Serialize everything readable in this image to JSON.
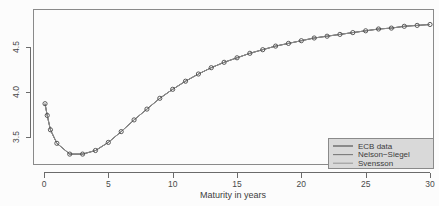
{
  "chart_data": {
    "type": "line",
    "title": "",
    "xlabel": "Maturity in years",
    "ylabel": "",
    "xlim": [
      -1.2,
      31.5
    ],
    "ylim": [
      3.2,
      4.85
    ],
    "xticks": [
      0,
      5,
      10,
      15,
      20,
      25,
      30
    ],
    "xtick_labels": [
      "0",
      "5",
      "10",
      "15",
      "20",
      "25",
      "30"
    ],
    "yticks": [
      3.5,
      4.0,
      4.5
    ],
    "ytick_labels": [
      "3.5",
      "4.0",
      "4.5"
    ],
    "grid": false,
    "legend_position": "bottom-right",
    "x": [
      0.08,
      0.25,
      0.5,
      1,
      2,
      3,
      4,
      5,
      6,
      7,
      8,
      9,
      10,
      11,
      12,
      13,
      14,
      15,
      16,
      17,
      18,
      19,
      20,
      21,
      22,
      23,
      24,
      25,
      26,
      27,
      28,
      29,
      30
    ],
    "series": [
      {
        "name": "ECB data",
        "color": "#4a4a4a",
        "marker": "circle",
        "values": [
          3.87,
          3.74,
          3.58,
          3.43,
          3.31,
          3.31,
          3.35,
          3.44,
          3.56,
          3.69,
          3.81,
          3.93,
          4.03,
          4.12,
          4.2,
          4.27,
          4.33,
          4.38,
          4.43,
          4.47,
          4.51,
          4.54,
          4.57,
          4.6,
          4.62,
          4.64,
          4.66,
          4.68,
          4.7,
          4.71,
          4.73,
          4.74,
          4.75
        ]
      },
      {
        "name": "Nelson−Siegel",
        "color": "#6e6e6e",
        "marker": "none",
        "values": [
          3.87,
          3.74,
          3.58,
          3.43,
          3.31,
          3.31,
          3.35,
          3.44,
          3.56,
          3.69,
          3.81,
          3.93,
          4.03,
          4.12,
          4.2,
          4.27,
          4.33,
          4.38,
          4.43,
          4.47,
          4.51,
          4.54,
          4.57,
          4.6,
          4.62,
          4.64,
          4.66,
          4.68,
          4.7,
          4.71,
          4.73,
          4.74,
          4.75
        ]
      },
      {
        "name": "Svensson",
        "color": "#8c8c8c",
        "marker": "none",
        "values": [
          3.87,
          3.74,
          3.58,
          3.43,
          3.31,
          3.31,
          3.35,
          3.44,
          3.56,
          3.69,
          3.81,
          3.93,
          4.03,
          4.12,
          4.2,
          4.27,
          4.33,
          4.38,
          4.43,
          4.47,
          4.51,
          4.54,
          4.57,
          4.6,
          4.62,
          4.64,
          4.66,
          4.68,
          4.7,
          4.71,
          4.73,
          4.74,
          4.75
        ]
      }
    ]
  },
  "legend": {
    "entries": [
      {
        "label": "ECB data",
        "color": "#4a4a4a"
      },
      {
        "label": "Nelson−Siegel",
        "color": "#7a7a7a"
      },
      {
        "label": "Svensson",
        "color": "#9a9a9a"
      }
    ],
    "background": "#d9d9d9"
  },
  "axes": {
    "x_title": "Maturity in years"
  }
}
